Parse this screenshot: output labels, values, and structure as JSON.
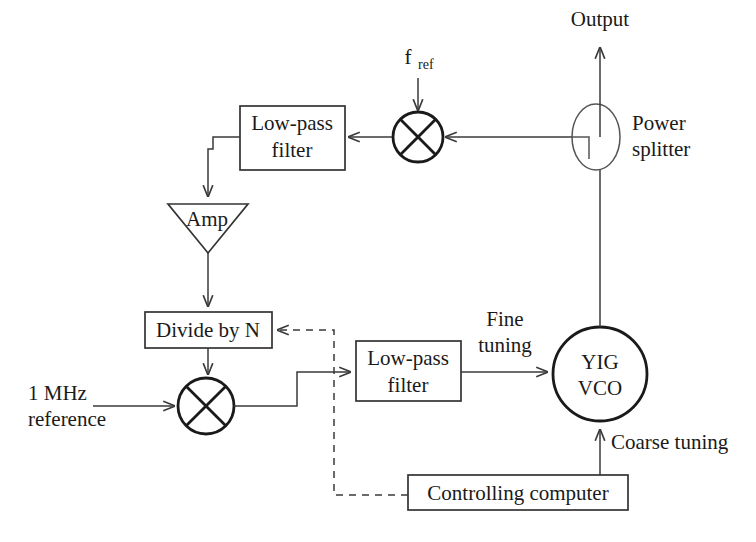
{
  "diagram": {
    "labels": {
      "f_ref_base": "f",
      "f_ref_sub": "ref",
      "output": "Output",
      "power_splitter_line1": "Power",
      "power_splitter_line2": "splitter",
      "lpf_top_line1": "Low-pass",
      "lpf_top_line2": "filter",
      "amp": "Amp",
      "divide_by_n": "Divide by N",
      "ref_line1": "1 MHz",
      "ref_line2": "reference",
      "lpf_mid_line1": "Low-pass",
      "lpf_mid_line2": "filter",
      "fine_tuning_line1": "Fine",
      "fine_tuning_line2": "tuning",
      "yig_line1": "YIG",
      "yig_line2": "VCO",
      "coarse_tuning": "Coarse tuning",
      "controlling_computer": "Controlling computer"
    },
    "colors": {
      "stroke": "#333333",
      "thick_stroke": "#1a1a1a",
      "text": "#1a1a1a",
      "background": "#ffffff"
    }
  }
}
